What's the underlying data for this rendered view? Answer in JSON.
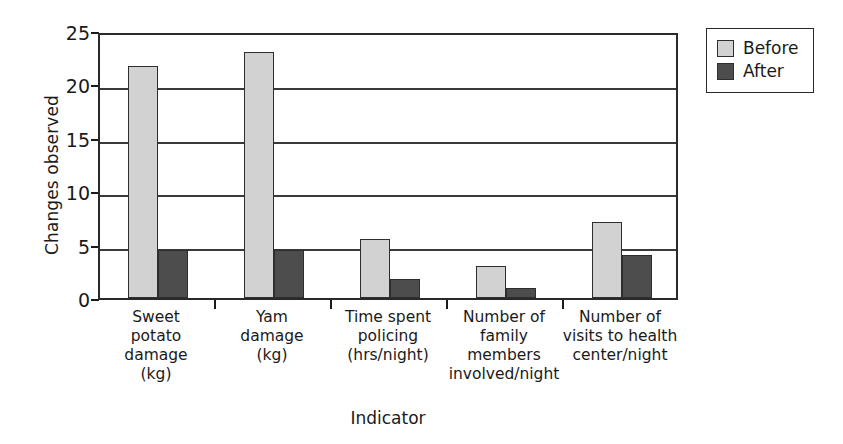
{
  "chart_data": {
    "type": "bar",
    "title": "",
    "xlabel": "Indicator",
    "ylabel": "Changes observed",
    "ylim": [
      0,
      25
    ],
    "yticks": [
      0,
      5,
      10,
      15,
      20,
      25
    ],
    "grid": true,
    "legend_position": "top-right",
    "categories": [
      "Sweet\npotato\ndamage\n(kg)",
      "Yam\ndamage\n(kg)",
      "Time spent\npolicing\n(hrs/night)",
      "Number of\nfamily\nmembers\ninvolved/night",
      "Number of\nvisits to health\ncenter/night"
    ],
    "category_labels_flat": [
      "Sweet potato damage (kg)",
      "Yam damage (kg)",
      "Time spent policing (hrs/night)",
      "Number of family members involved/night",
      "Number of visits to health center/night"
    ],
    "series": [
      {
        "name": "Before",
        "color": "#d2d2d2",
        "values": [
          21.7,
          23.0,
          5.5,
          3.0,
          7.1
        ]
      },
      {
        "name": "After",
        "color": "#4d4d4d",
        "values": [
          4.5,
          4.5,
          1.8,
          0.9,
          4.0
        ]
      }
    ]
  },
  "legend": {
    "items": [
      {
        "label": "Before",
        "color": "#d2d2d2"
      },
      {
        "label": "After",
        "color": "#4d4d4d"
      }
    ]
  },
  "axes": {
    "y_title": "Changes observed",
    "x_title": "Indicator"
  }
}
